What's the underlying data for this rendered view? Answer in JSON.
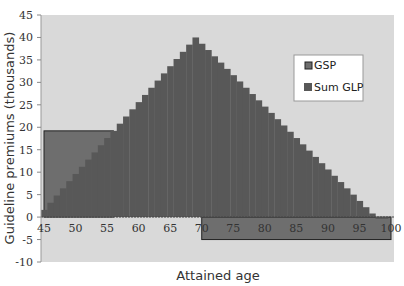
{
  "chart_data": {
    "type": "bar",
    "title": "",
    "xlabel": "Attained age",
    "ylabel": "Guideline premiums (thousands)",
    "ylim": [
      -10,
      45
    ],
    "xlim": [
      45,
      100
    ],
    "y_ticks": [
      -10,
      -5,
      0,
      5,
      10,
      15,
      20,
      25,
      30,
      35,
      40,
      45
    ],
    "x_ticks": [
      45,
      50,
      55,
      60,
      65,
      70,
      75,
      80,
      85,
      90,
      95,
      100
    ],
    "grid": false,
    "legend_position": "upper right",
    "categories": [
      45,
      46,
      47,
      48,
      49,
      50,
      51,
      52,
      53,
      54,
      55,
      56,
      57,
      58,
      59,
      60,
      61,
      62,
      63,
      64,
      65,
      66,
      67,
      68,
      69,
      70,
      71,
      72,
      73,
      74,
      75,
      76,
      77,
      78,
      79,
      80,
      81,
      82,
      83,
      84,
      85,
      86,
      87,
      88,
      89,
      90,
      91,
      92,
      93,
      94,
      95,
      96,
      97,
      98,
      99
    ],
    "series": [
      {
        "name": "Sum GLP",
        "color": "#585858",
        "values": [
          1.6,
          3.2,
          4.8,
          6.4,
          8.0,
          9.6,
          11.2,
          12.8,
          14.4,
          16.0,
          17.6,
          19.2,
          20.8,
          22.4,
          24.0,
          25.6,
          27.2,
          28.8,
          30.4,
          32.0,
          33.6,
          35.2,
          36.8,
          38.4,
          40.0,
          38.6,
          37.2,
          35.8,
          34.4,
          33.0,
          31.6,
          30.2,
          28.8,
          27.4,
          26.0,
          24.6,
          23.2,
          21.8,
          20.4,
          19.0,
          17.6,
          16.2,
          14.8,
          13.4,
          12.0,
          10.6,
          9.2,
          7.8,
          6.4,
          5.0,
          3.6,
          2.2,
          0.8,
          -0.4,
          -0.4
        ]
      },
      {
        "name": "GSP",
        "color": "#6e6e6e",
        "segments": [
          {
            "x_start": 45,
            "x_end": 56,
            "value": 19.2
          },
          {
            "x_start": 70,
            "x_end": 100,
            "value": -5.0
          }
        ]
      }
    ]
  },
  "legend": {
    "items": [
      {
        "label": "GSP",
        "color": "#6e6e6e"
      },
      {
        "label": "Sum GLP",
        "color": "#585858"
      }
    ]
  },
  "axes": {
    "x_title": "Attained age",
    "y_title": "Guideline premiums (thousands)"
  }
}
